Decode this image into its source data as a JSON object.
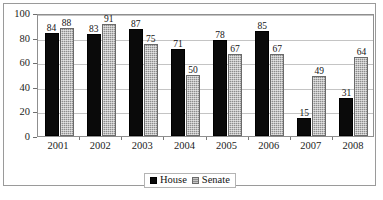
{
  "chart_data": {
    "type": "bar",
    "title": "",
    "xlabel": "",
    "ylabel": "",
    "ylim": [
      0,
      100
    ],
    "yticks": [
      0,
      20,
      40,
      60,
      80,
      100
    ],
    "grid": true,
    "legend_position": "bottom",
    "categories": [
      "2001",
      "2002",
      "2003",
      "2004",
      "2005",
      "2006",
      "2007",
      "2008"
    ],
    "series": [
      {
        "name": "House",
        "color": "#0a0a0a",
        "values": [
          84,
          83,
          87,
          71,
          78,
          85,
          15,
          31
        ]
      },
      {
        "name": "Senate",
        "color": "#8d8d8d",
        "values": [
          88,
          91,
          75,
          50,
          67,
          67,
          49,
          64
        ]
      }
    ]
  },
  "legend": {
    "items": [
      {
        "label": "House"
      },
      {
        "label": "Senate"
      }
    ]
  },
  "caption": {
    "clipped_line": " "
  }
}
